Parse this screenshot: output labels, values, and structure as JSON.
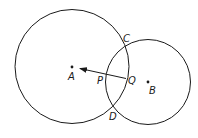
{
  "diagram": {
    "type": "intersecting-circles",
    "colors": {
      "stroke": "#1a1a1a",
      "background": "#ffffff"
    },
    "circles": [
      {
        "name": "circle-A",
        "center_label": "A",
        "cx": 72,
        "cy": 66.5,
        "r": 57
      },
      {
        "name": "circle-B",
        "center_label": "B",
        "cx": 148,
        "cy": 82,
        "r": 42.5
      }
    ],
    "points": {
      "A": {
        "label": "A",
        "x": 72,
        "y": 67
      },
      "B": {
        "label": "B",
        "x": 148,
        "y": 82
      },
      "C": {
        "label": "C"
      },
      "D": {
        "label": "D"
      },
      "P": {
        "label": "P"
      },
      "Q": {
        "label": "Q"
      }
    },
    "arrow": {
      "from": "Q",
      "toward": "A",
      "passes_through": "P"
    }
  }
}
